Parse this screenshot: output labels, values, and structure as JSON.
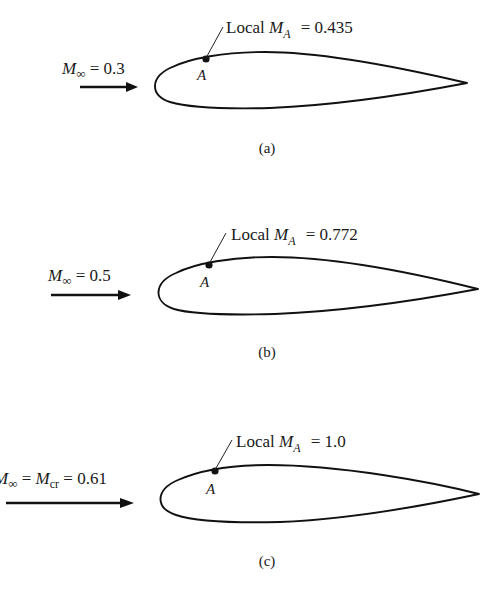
{
  "figure": {
    "colors": {
      "ink": "#111111",
      "background": "#ffffff"
    },
    "panels": [
      {
        "id": "a",
        "caption": "(a)",
        "freestream_label": {
          "symbol": "M",
          "subscript": "∞",
          "text": " = 0.3",
          "value": 0.3
        },
        "local_label": {
          "prefix": "Local ",
          "symbol": "M",
          "subscript": "A",
          "text": " = 0.435",
          "value": 0.435
        },
        "point_label": "A"
      },
      {
        "id": "b",
        "caption": "(b)",
        "freestream_label": {
          "symbol": "M",
          "subscript": "∞",
          "text": " = 0.5",
          "value": 0.5
        },
        "local_label": {
          "prefix": "Local ",
          "symbol": "M",
          "subscript": "A",
          "text": " = 0.772",
          "value": 0.772
        },
        "point_label": "A"
      },
      {
        "id": "c",
        "caption": "(c)",
        "freestream_label": {
          "symbol": "M",
          "subscript": "∞",
          "mid": " = ",
          "symbol2": "M",
          "subscript2": "cr",
          "text": " = 0.61",
          "value": 0.61
        },
        "local_label": {
          "prefix": "Local ",
          "symbol": "M",
          "subscript": "A",
          "text": " = 1.0",
          "value": 1.0
        },
        "point_label": "A"
      }
    ]
  }
}
